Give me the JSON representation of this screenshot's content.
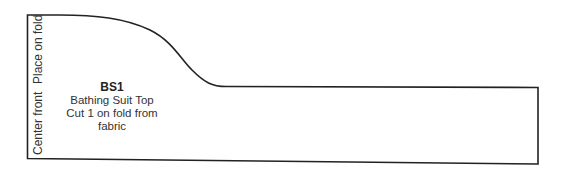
{
  "pattern_piece": {
    "code": "BS1",
    "name": "Bathing Suit Top",
    "instruction": "Cut 1 on fold from fabric",
    "fold_edge_labels": {
      "upper": "Place on fold",
      "lower": "Center front"
    },
    "outline_color": "#222222"
  }
}
